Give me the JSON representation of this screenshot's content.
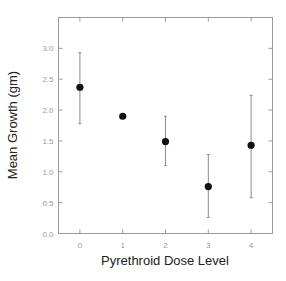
{
  "chart_data": {
    "type": "scatter",
    "title": "",
    "xlabel": "Pyrethroid Dose Level",
    "ylabel": "Mean Growth (gm)",
    "x": [
      0,
      1,
      2,
      3,
      4
    ],
    "categories": [
      "0",
      "1",
      "2",
      "3",
      "4"
    ],
    "series": [
      {
        "name": "Mean Growth",
        "values": [
          2.37,
          1.9,
          1.49,
          0.76,
          1.43
        ],
        "error_upper": [
          2.93,
          1.9,
          1.9,
          1.28,
          2.24
        ],
        "error_lower": [
          1.78,
          1.9,
          1.1,
          0.26,
          0.58
        ]
      }
    ],
    "xlim": [
      -0.5,
      4.5
    ],
    "ylim": [
      0.0,
      3.5
    ],
    "yticks": [
      "0.0",
      "0.5",
      "1.0",
      "1.5",
      "2.0",
      "2.5",
      "3.0"
    ],
    "xticks": [
      "0",
      "1",
      "2",
      "3",
      "4"
    ],
    "grid": false,
    "legend": null
  },
  "colors": {
    "axis": "#9a9a9a",
    "marker": "#111111",
    "errorbar": "#8a8a8a",
    "text": "#222222"
  }
}
